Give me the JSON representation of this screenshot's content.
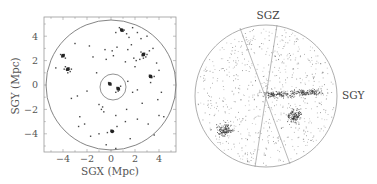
{
  "chart_data": [
    {
      "type": "scatter",
      "panel": "left",
      "title": "",
      "xlabel": "SGX (Mpc)",
      "ylabel": "SGY (Mpc)",
      "xlim": [
        -5.6,
        5.5
      ],
      "ylim": [
        -5.5,
        5.5
      ],
      "x_ticks": [
        -4,
        -2,
        0,
        2,
        4
      ],
      "y_ticks": [
        -4,
        -2,
        0,
        2,
        4
      ],
      "grid": false,
      "legend": null,
      "annotations": [
        {
          "shape": "circle",
          "center": [
            0,
            0
          ],
          "radius": 5.4
        },
        {
          "shape": "circle",
          "center": [
            0.15,
            -0.15
          ],
          "radius": 1.05
        }
      ],
      "clusters": [
        {
          "x": 0.9,
          "y": 4.5,
          "density": "group"
        },
        {
          "x": 2.7,
          "y": 2.5,
          "density": "group"
        },
        {
          "x": -4.0,
          "y": 2.4,
          "density": "group"
        },
        {
          "x": -3.6,
          "y": 1.3,
          "density": "group"
        },
        {
          "x": 3.3,
          "y": 0.7,
          "density": "group"
        },
        {
          "x": -0.1,
          "y": 0.1,
          "density": "group"
        },
        {
          "x": 0.6,
          "y": -0.3,
          "density": "group"
        },
        {
          "x": 0.1,
          "y": -3.8,
          "density": "group"
        }
      ],
      "points": [
        [
          0.9,
          4.5
        ],
        [
          0.8,
          4.6
        ],
        [
          1.0,
          4.4
        ],
        [
          0.7,
          4.7
        ],
        [
          1.1,
          4.5
        ],
        [
          1.3,
          4.2
        ],
        [
          0.4,
          4.3
        ],
        [
          1.8,
          4.7
        ],
        [
          2.2,
          4.3
        ],
        [
          1.5,
          3.9
        ],
        [
          2.7,
          2.5
        ],
        [
          2.8,
          2.6
        ],
        [
          2.6,
          2.4
        ],
        [
          2.9,
          2.3
        ],
        [
          2.5,
          2.7
        ],
        [
          2.7,
          2.2
        ],
        [
          3.0,
          2.5
        ],
        [
          2.4,
          2.1
        ],
        [
          3.2,
          2.8
        ],
        [
          2.1,
          2.0
        ],
        [
          -4.0,
          2.4
        ],
        [
          -3.9,
          2.5
        ],
        [
          -4.1,
          2.3
        ],
        [
          -3.8,
          2.2
        ],
        [
          -4.2,
          2.5
        ],
        [
          -3.6,
          1.3
        ],
        [
          -3.5,
          1.4
        ],
        [
          -3.7,
          1.2
        ],
        [
          -3.4,
          1.1
        ],
        [
          -3.8,
          1.5
        ],
        [
          -3.3,
          1.3
        ],
        [
          -3.6,
          1.0
        ],
        [
          -3.9,
          1.3
        ],
        [
          3.3,
          0.7
        ],
        [
          3.4,
          0.6
        ],
        [
          3.2,
          0.8
        ],
        [
          3.6,
          0.7
        ],
        [
          3.3,
          0.2
        ],
        [
          -0.1,
          0.1
        ],
        [
          0.0,
          0.0
        ],
        [
          -0.2,
          0.2
        ],
        [
          0.6,
          -0.3
        ],
        [
          0.7,
          -0.4
        ],
        [
          0.5,
          -0.2
        ],
        [
          0.8,
          -0.1
        ],
        [
          0.6,
          -0.5
        ],
        [
          0.4,
          -0.6
        ],
        [
          0.1,
          -3.8
        ],
        [
          0.2,
          -3.8
        ],
        [
          0.0,
          -3.7
        ],
        [
          0.5,
          -3.4
        ],
        [
          -0.3,
          -3.9
        ],
        [
          -0.5,
          2.9
        ],
        [
          0.1,
          2.8
        ],
        [
          0.5,
          3.1
        ],
        [
          0.2,
          2.4
        ],
        [
          -0.4,
          2.1
        ],
        [
          1.4,
          2.9
        ],
        [
          1.7,
          3.3
        ],
        [
          1.9,
          2.2
        ],
        [
          2.0,
          1.5
        ],
        [
          1.2,
          1.9
        ],
        [
          3.5,
          3.0
        ],
        [
          3.8,
          1.8
        ],
        [
          4.0,
          1.2
        ],
        [
          4.2,
          -0.6
        ],
        [
          3.9,
          -1.2
        ],
        [
          4.0,
          -2.5
        ],
        [
          4.4,
          -2.6
        ],
        [
          3.1,
          -3.2
        ],
        [
          3.6,
          -4.1
        ],
        [
          2.6,
          -1.5
        ],
        [
          -1.0,
          -1.6
        ],
        [
          -0.8,
          -2.0
        ],
        [
          -0.6,
          -2.2
        ],
        [
          -0.7,
          -1.8
        ],
        [
          -2.6,
          -2.6
        ],
        [
          -2.2,
          -3.2
        ],
        [
          -2.7,
          -3.4
        ],
        [
          -1.7,
          -4.2
        ],
        [
          -1.0,
          -4.0
        ],
        [
          -2.8,
          -0.9
        ],
        [
          -3.3,
          -1.1
        ],
        [
          -2.0,
          -0.5
        ],
        [
          -4.6,
          1.4
        ],
        [
          -3.0,
          3.4
        ],
        [
          -1.8,
          3.2
        ],
        [
          -1.2,
          1.0
        ],
        [
          1.4,
          0.3
        ],
        [
          1.8,
          -0.6
        ],
        [
          2.2,
          -0.4
        ],
        [
          1.3,
          -2.0
        ],
        [
          1.2,
          -3.0
        ],
        [
          0.4,
          -2.5
        ],
        [
          -0.4,
          -4.9
        ],
        [
          0.4,
          -5.2
        ],
        [
          -1.5,
          2.3
        ],
        [
          2.5,
          3.8
        ],
        [
          3.0,
          4.0
        ],
        [
          2.2,
          -2.8
        ],
        [
          1.6,
          -4.4
        ]
      ]
    },
    {
      "type": "scatter",
      "panel": "right",
      "title": "",
      "projection": "circular sky projection with zone-of-avoidance wedge",
      "axis_directions": {
        "up": "SGZ",
        "right": "SGY"
      },
      "annotations": [
        {
          "shape": "circle",
          "description": "projection boundary"
        },
        {
          "shape": "wedge",
          "description": "two lines crossing at center, excluded region toward top and bottom"
        }
      ],
      "clusters": [
        {
          "u": 0.95,
          "v": 0.1,
          "description": "elongated dense band right of center"
        },
        {
          "u": 0.3,
          "v": 0.05,
          "description": "band extending left from center"
        },
        {
          "u": 0.7,
          "v": -0.5,
          "description": "dense group lower right of center"
        },
        {
          "u": -1.05,
          "v": -0.85,
          "description": "group lower left"
        }
      ]
    }
  ],
  "left_panel": {
    "xlabel": "SGX (Mpc)",
    "ylabel": "SGY (Mpc)",
    "x_tick_labels": [
      "−4",
      "−2",
      "0",
      "2",
      "4"
    ],
    "y_tick_labels": [
      "4",
      "2",
      "0",
      "−2",
      "−4"
    ]
  },
  "right_panel": {
    "top_label": "SGZ",
    "right_label": "SGY"
  }
}
